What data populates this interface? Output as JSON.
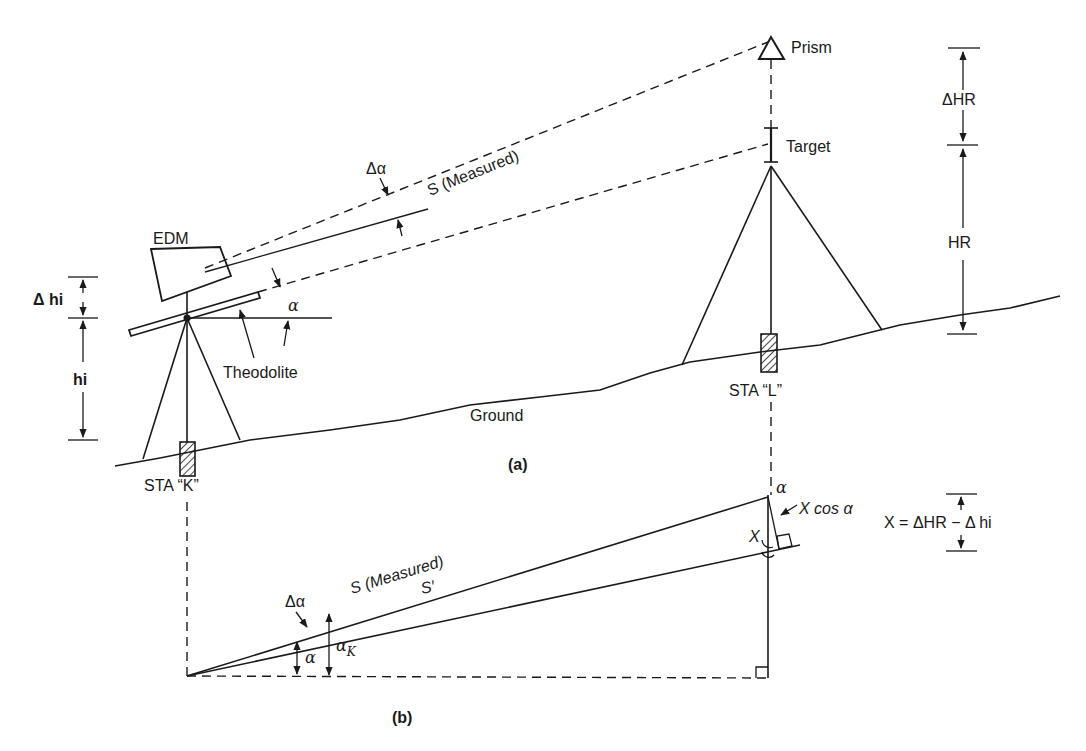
{
  "figure": {
    "panel_a": {
      "caption": "(a)",
      "labels": {
        "prism": "Prism",
        "target": "Target",
        "measured_line": "S (Measured)",
        "delta_alpha": "Δα",
        "edm": "EDM",
        "delta_hi": "Δ hi",
        "hi": "hi",
        "alpha": "α",
        "theodolite": "Theodolite",
        "ground": "Ground",
        "station_k": "STA “K”",
        "station_l": "STA “L”",
        "delta_hr": "ΔHR",
        "hr": "HR"
      }
    },
    "panel_b": {
      "caption": "(b)",
      "labels": {
        "alpha_top": "α",
        "x_cos_alpha": "X cos α",
        "x": "X",
        "measured_line": "S (Measured)",
        "s_prime": "S′",
        "delta_alpha": "Δα",
        "alpha": "α",
        "alpha_k": "α",
        "alpha_k_sub": "K",
        "formula": "X = ΔHR − Δ hi"
      }
    }
  },
  "colors": {
    "ink": "#1a1a1a",
    "paper": "#ffffff"
  }
}
